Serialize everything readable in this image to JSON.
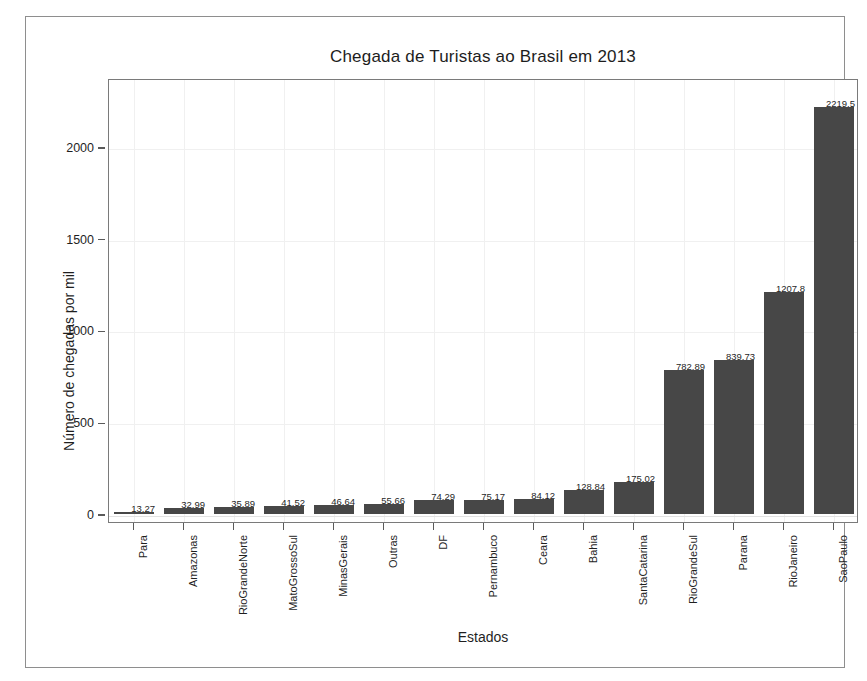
{
  "chart_data": {
    "type": "bar",
    "title": "Chegada de Turistas ao Brasil em 2013",
    "xlabel": "Estados",
    "ylabel": "Número de chegadas por mil",
    "categories": [
      "Para",
      "Amazonas",
      "RioGrandeNorte",
      "MatoGrossoSul",
      "MinasGerais",
      "Outras",
      "DF",
      "Pernambuco",
      "Ceara",
      "Bahia",
      "SantaCatarina",
      "RioGrandeSul",
      "Parana",
      "RioJaneiro",
      "SaoPaulo"
    ],
    "values": [
      13.27,
      32.99,
      35.89,
      41.52,
      46.64,
      55.66,
      74.29,
      75.17,
      84.12,
      128.84,
      175.02,
      782.89,
      839.73,
      1207.8,
      2219.5
    ],
    "value_labels": [
      "13.27",
      "32.99",
      "35.89",
      "41.52",
      "46.64",
      "55.66",
      "74.29",
      "75.17",
      "84.12",
      "128.84",
      "175.02",
      "782.89",
      "839.73",
      "1207.8",
      "2219.5"
    ],
    "yticks": [
      0,
      500,
      1000,
      1500,
      2000
    ],
    "ytick_labels": [
      "0",
      "500",
      "1000",
      "1500",
      "2000"
    ],
    "ylim": [
      0,
      2375
    ],
    "grid": true,
    "legend": "none",
    "bar_color": "#474747",
    "axis_color": "#7a7a7a",
    "grid_color": "#f0f0f0",
    "text_color": "#1f1f1f",
    "background": "#ffffff"
  }
}
